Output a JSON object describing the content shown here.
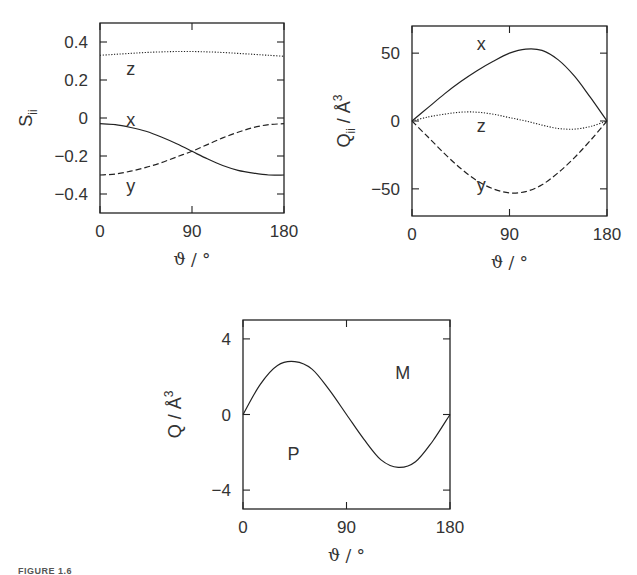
{
  "caption": "FIGURE 1.6",
  "chart_data": [
    {
      "type": "line",
      "id": "panel-order-parameter",
      "frame": {
        "x": 100,
        "y": 23,
        "w": 184,
        "h": 190
      },
      "xlabel": "ϑ / °",
      "ylabel": "S",
      "ylabel_sub": "ii",
      "ylabel_sup": "",
      "xlim": [
        0,
        180
      ],
      "ylim": [
        -0.5,
        0.5
      ],
      "xticks": [
        0,
        90,
        180
      ],
      "xtick_labels": [
        "0",
        "90",
        "180"
      ],
      "yticks": [
        0.4,
        0.2,
        0,
        -0.2,
        -0.4
      ],
      "ytick_labels": [
        "0.4",
        "0.2",
        "0",
        "−0.2",
        "−0.4"
      ],
      "grid": false,
      "x": [
        0,
        15,
        30,
        45,
        60,
        75,
        90,
        105,
        120,
        135,
        150,
        165,
        180
      ],
      "series": [
        {
          "name": "x",
          "style": "solid",
          "values": [
            -0.03,
            -0.035,
            -0.05,
            -0.07,
            -0.1,
            -0.135,
            -0.175,
            -0.215,
            -0.25,
            -0.275,
            -0.29,
            -0.3,
            -0.3
          ],
          "label_pos": [
            30,
            -0.01
          ]
        },
        {
          "name": "y",
          "style": "dashed",
          "values": [
            -0.3,
            -0.295,
            -0.28,
            -0.26,
            -0.235,
            -0.205,
            -0.175,
            -0.14,
            -0.105,
            -0.075,
            -0.05,
            -0.035,
            -0.03
          ],
          "label_pos": [
            30,
            -0.36
          ]
        },
        {
          "name": "z",
          "style": "dotted",
          "values": [
            0.33,
            0.335,
            0.34,
            0.345,
            0.348,
            0.35,
            0.35,
            0.348,
            0.345,
            0.34,
            0.335,
            0.33,
            0.325
          ],
          "label_pos": [
            30,
            0.26
          ]
        }
      ]
    },
    {
      "type": "line",
      "id": "panel-quadrupole-components",
      "frame": {
        "x": 412,
        "y": 26,
        "w": 195,
        "h": 190
      },
      "xlabel": "ϑ / °",
      "ylabel": "Q",
      "ylabel_sub": "ii",
      "ylabel_sup": "3",
      "ylabel_unit": " / Å",
      "xlim": [
        0,
        180
      ],
      "ylim": [
        -70,
        70
      ],
      "xticks": [
        0,
        90,
        180
      ],
      "xtick_labels": [
        "0",
        "90",
        "180"
      ],
      "yticks": [
        50,
        0,
        -50
      ],
      "ytick_labels": [
        "50",
        "0",
        "−50"
      ],
      "grid": false,
      "x": [
        0,
        15,
        30,
        45,
        60,
        75,
        90,
        105,
        120,
        135,
        150,
        165,
        180
      ],
      "series": [
        {
          "name": "x",
          "style": "solid",
          "values": [
            0,
            10,
            20,
            29,
            37,
            44,
            50,
            53,
            52,
            45,
            33,
            17,
            0
          ],
          "label_pos": [
            64,
            57
          ]
        },
        {
          "name": "y",
          "style": "dashed",
          "values": [
            0,
            -12,
            -24,
            -35,
            -44,
            -50,
            -53,
            -52,
            -47,
            -38,
            -27,
            -14,
            0
          ],
          "label_pos": [
            64,
            -47
          ]
        },
        {
          "name": "z",
          "style": "dotted",
          "values": [
            0,
            3,
            5,
            6.5,
            6.5,
            5,
            2.5,
            0,
            -3,
            -5.5,
            -6,
            -4,
            0
          ],
          "label_pos": [
            64,
            -4
          ]
        }
      ]
    },
    {
      "type": "line",
      "id": "panel-total-quadrupole",
      "frame": {
        "x": 243,
        "y": 320,
        "w": 207,
        "h": 189
      },
      "xlabel": "ϑ / °",
      "ylabel": "Q",
      "ylabel_sub": "",
      "ylabel_sup": "3",
      "ylabel_unit": " / Å",
      "xlim": [
        0,
        180
      ],
      "ylim": [
        -5,
        5
      ],
      "xticks": [
        0,
        90,
        180
      ],
      "xtick_labels": [
        "0",
        "90",
        "180"
      ],
      "yticks": [
        4,
        0,
        -4
      ],
      "ytick_labels": [
        "4",
        "0",
        "−4"
      ],
      "grid": false,
      "x": [
        0,
        15,
        30,
        45,
        60,
        75,
        90,
        105,
        120,
        135,
        150,
        165,
        180
      ],
      "series": [
        {
          "name": "Q",
          "style": "solid",
          "values": [
            0,
            1.6,
            2.6,
            2.8,
            2.4,
            1.3,
            0,
            -1.3,
            -2.4,
            -2.8,
            -2.5,
            -1.4,
            0
          ]
        }
      ],
      "annotations": [
        {
          "text": "M",
          "x": 139,
          "y": 2.2
        },
        {
          "text": "P",
          "x": 44,
          "y": -2.1
        }
      ]
    }
  ]
}
